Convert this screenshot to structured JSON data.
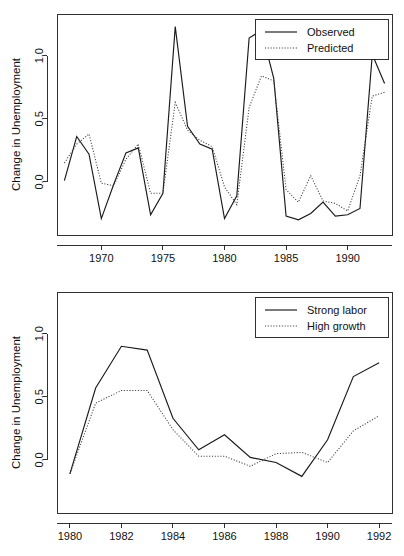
{
  "chart_data": [
    {
      "id": "observed-vs-predicted",
      "type": "line",
      "title": "",
      "xlabel": "",
      "ylabel": "Change in Unemployment",
      "xlim": [
        1966.4,
        1993.6
      ],
      "ylim": [
        -0.42,
        1.33
      ],
      "xticks": [
        1970,
        1975,
        1980,
        1985,
        1990
      ],
      "xticklabels": [
        "1970",
        "1975",
        "1980",
        "1985",
        "1990"
      ],
      "yticks": [
        0.0,
        0.5,
        1.0
      ],
      "yticklabels": [
        "0.0",
        "0.5",
        "1.0"
      ],
      "grid": false,
      "legend_position": "top-right",
      "x": [
        1967,
        1968,
        1969,
        1970,
        1971,
        1972,
        1973,
        1974,
        1975,
        1976,
        1977,
        1978,
        1979,
        1980,
        1981,
        1982,
        1983,
        1984,
        1985,
        1986,
        1987,
        1988,
        1989,
        1990,
        1991,
        1992,
        1993
      ],
      "series": [
        {
          "name": "Observed",
          "style": "solid",
          "values": [
            0.01,
            0.36,
            0.22,
            -0.29,
            -0.02,
            0.23,
            0.27,
            -0.26,
            -0.09,
            1.23,
            0.44,
            0.3,
            0.26,
            -0.29,
            -0.11,
            1.14,
            1.2,
            0.82,
            -0.27,
            -0.3,
            -0.25,
            -0.16,
            -0.27,
            -0.26,
            -0.21,
            1.01,
            0.78
          ]
        },
        {
          "name": "Predicted",
          "style": "dotted",
          "values": [
            0.15,
            0.3,
            0.38,
            -0.01,
            -0.03,
            0.18,
            0.3,
            -0.09,
            -0.09,
            0.63,
            0.41,
            0.33,
            0.28,
            -0.04,
            -0.18,
            0.59,
            0.84,
            0.8,
            -0.06,
            -0.16,
            0.05,
            -0.15,
            -0.17,
            -0.23,
            0.05,
            0.68,
            0.71
          ]
        }
      ]
    },
    {
      "id": "scenario-projections",
      "type": "line",
      "title": "",
      "xlabel": "",
      "ylabel": "Change in Unemployment",
      "xlim": [
        1979.5,
        1992.5
      ],
      "ylim": [
        -0.42,
        1.33
      ],
      "xticks": [
        1980,
        1982,
        1984,
        1986,
        1988,
        1990,
        1992
      ],
      "xticklabels": [
        "1980",
        "1982",
        "1984",
        "1986",
        "1988",
        "1990",
        "1992"
      ],
      "yticks": [
        0.0,
        0.5,
        1.0
      ],
      "yticklabels": [
        "0.0",
        "0.5",
        "1.0"
      ],
      "grid": false,
      "legend_position": "top-right",
      "x": [
        1980,
        1981,
        1982,
        1983,
        1984,
        1985,
        1986,
        1987,
        1988,
        1989,
        1990,
        1991,
        1992
      ],
      "series": [
        {
          "name": "Strong labor",
          "style": "solid",
          "values": [
            -0.11,
            0.57,
            0.9,
            0.87,
            0.33,
            0.08,
            0.2,
            0.02,
            -0.02,
            -0.13,
            0.16,
            0.66,
            0.77
          ]
        },
        {
          "name": "High growth",
          "style": "dotted",
          "values": [
            -0.11,
            0.45,
            0.55,
            0.55,
            0.24,
            0.03,
            0.03,
            -0.05,
            0.05,
            0.06,
            -0.02,
            0.23,
            0.35
          ]
        }
      ]
    }
  ]
}
